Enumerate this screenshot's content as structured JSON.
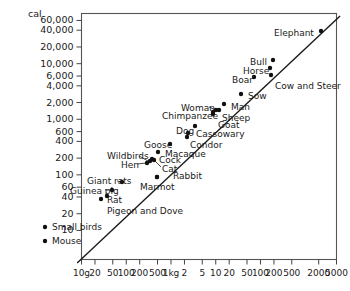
{
  "chart_data": {
    "type": "scatter",
    "title": "",
    "xlabel": "",
    "ylabel": "",
    "yunit": "cal.",
    "x_scale": "log",
    "y_scale": "log",
    "grid": false,
    "legend": "none",
    "xlim": [
      10,
      5000
    ],
    "ylim": [
      3,
      80000
    ],
    "xticklabels": [
      "10g",
      "20",
      "50",
      "100",
      "200",
      "500",
      "1kg",
      "2",
      "5",
      "10",
      "20",
      "50",
      "100",
      "200",
      "500",
      "2000",
      "5000"
    ],
    "xtickvalues": [
      10,
      20,
      50,
      100,
      200,
      500,
      1000,
      2000,
      5000,
      10000,
      20000,
      50000,
      100000,
      200000,
      500000,
      2000000,
      5000000
    ],
    "yticklabels": [
      "60,000",
      "40,000",
      "20,000",
      "10,000",
      "6,000",
      "4,000",
      "2,000",
      "1,000",
      "600",
      "400",
      "200",
      "100",
      "60",
      "40",
      "20",
      "10"
    ],
    "ytickvalues": [
      60000,
      40000,
      20000,
      10000,
      6000,
      4000,
      2000,
      1000,
      600,
      400,
      200,
      100,
      60,
      40,
      20,
      10
    ],
    "fitline": {
      "label": "",
      "x0": 8,
      "y0": 2.6,
      "x1": 6000000,
      "y1": 72000
    },
    "points": [
      {
        "label": "Mouse",
        "mass_g": 21,
        "cal": 3.6,
        "lx": 45,
        "ly": 241,
        "tx": 52,
        "ty": 237
      },
      {
        "label": "Small birds",
        "mass_g": 22,
        "cal": 5.4,
        "lx": 45,
        "ly": 227,
        "tx": 52,
        "ty": 223
      },
      {
        "label": "Rat",
        "mass_g": 300,
        "cal": 28,
        "lx": 101,
        "ly": 199,
        "tx": 107,
        "ty": 196
      },
      {
        "label": "Pigeon and Dove",
        "mass_g": 350,
        "cal": 30,
        "lx": 107,
        "ly": 196,
        "tx": 107,
        "ty": 207
      },
      {
        "label": "Guinea pig",
        "mass_g": 480,
        "cal": 38,
        "lx": 112,
        "ly": 190,
        "tx": 70,
        "ty": 187
      },
      {
        "label": "Giant rats",
        "mass_g": 760,
        "cal": 47,
        "lx": 122,
        "ly": 182,
        "tx": 87,
        "ty": 177
      },
      {
        "label": "Hen",
        "mass_g": 2000,
        "cal": 110,
        "lx": 147,
        "ly": 163,
        "tx": 121,
        "ty": 161
      },
      {
        "label": "Cock",
        "mass_g": 2400,
        "cal": 125,
        "lx": 152,
        "ly": 159,
        "tx": 159,
        "ty": 156
      },
      {
        "label": "Cat",
        "mass_g": 2700,
        "cal": 130,
        "lx": 154,
        "ly": 160,
        "tx": 162,
        "ty": 165
      },
      {
        "label": "Wildbirds",
        "mass_g": 2200,
        "cal": 120,
        "lx": 150,
        "ly": 161,
        "tx": 107,
        "ty": 152
      },
      {
        "label": "Macaque",
        "mass_g": 3200,
        "cal": 170,
        "lx": 158,
        "ly": 152,
        "tx": 165,
        "ty": 150
      },
      {
        "label": "Rabbit",
        "mass_g": 2700,
        "cal": 68,
        "lx": 157,
        "ly": 177,
        "tx": 173,
        "ty": 172
      },
      {
        "label": "Marmot",
        "mass_g": 2900,
        "cal": 70,
        "lx": 157,
        "ly": 177,
        "tx": 140,
        "ty": 183
      },
      {
        "label": "Goose",
        "mass_g": 5000,
        "cal": 215,
        "lx": 170,
        "ly": 144,
        "tx": 144,
        "ty": 141
      },
      {
        "label": "Condor",
        "mass_g": 11000,
        "cal": 290,
        "lx": 187,
        "ly": 137,
        "tx": 190,
        "ty": 141
      },
      {
        "label": "Cassowary",
        "mass_g": 11500,
        "cal": 350,
        "lx": 188,
        "ly": 133,
        "tx": 196,
        "ty": 130
      },
      {
        "label": "Dog",
        "mass_g": 17000,
        "cal": 470,
        "lx": 195,
        "ly": 126,
        "tx": 176,
        "ty": 127
      },
      {
        "label": "Goat",
        "mass_g": 36000,
        "cal": 800,
        "lx": 213,
        "ly": 114,
        "tx": 218,
        "ty": 121
      },
      {
        "label": "Chimpanzee",
        "mass_g": 38000,
        "cal": 1000,
        "lx": 213,
        "ly": 112,
        "tx": 162,
        "ty": 112
      },
      {
        "label": "Woman",
        "mass_g": 42000,
        "cal": 1100,
        "lx": 216,
        "ly": 110,
        "tx": 181,
        "ty": 104
      },
      {
        "label": "Sheep",
        "mass_g": 48000,
        "cal": 1150,
        "lx": 219,
        "ly": 110,
        "tx": 222,
        "ty": 114
      },
      {
        "label": "Man",
        "mass_g": 65000,
        "cal": 1400,
        "lx": 224,
        "ly": 104,
        "tx": 231,
        "ty": 103
      },
      {
        "label": "Sow",
        "mass_g": 140000,
        "cal": 2400,
        "lx": 241,
        "ly": 94,
        "tx": 248,
        "ty": 92
      },
      {
        "label": "Boar",
        "mass_g": 260000,
        "cal": 5300,
        "lx": 254,
        "ly": 77,
        "tx": 232,
        "ty": 76
      },
      {
        "label": "Horse",
        "mass_g": 500000,
        "cal": 8500,
        "lx": 270,
        "ly": 68,
        "tx": 243,
        "ty": 67
      },
      {
        "label": "Cow and Steer",
        "mass_g": 520000,
        "cal": 6100,
        "lx": 271,
        "ly": 75,
        "tx": 275,
        "ty": 82
      },
      {
        "label": "Bull",
        "mass_g": 540000,
        "cal": 11000,
        "lx": 273,
        "ly": 60,
        "tx": 250,
        "ty": 58
      },
      {
        "label": "Elephant",
        "mass_g": 3700000,
        "cal": 48000,
        "lx": 321,
        "ly": 31,
        "tx": 274,
        "ty": 29
      }
    ]
  },
  "axes": {
    "unit_label": "cal."
  }
}
